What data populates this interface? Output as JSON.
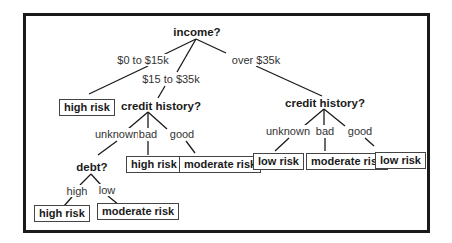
{
  "diagram": {
    "type": "decision-tree",
    "root": {
      "question": "income?",
      "branches": [
        {
          "label": "$0 to $15k",
          "result": "high risk"
        },
        {
          "label": "$15 to $35k",
          "question": "credit history?",
          "branches": [
            {
              "label": "unknown",
              "question": "debt?",
              "branches": [
                {
                  "label": "high",
                  "result": "high risk"
                },
                {
                  "label": "low",
                  "result": "moderate risk"
                }
              ]
            },
            {
              "label": "bad",
              "result": "high risk"
            },
            {
              "label": "good",
              "result": "moderate risk"
            }
          ]
        },
        {
          "label": "over $35k",
          "question": "credit history?",
          "branches": [
            {
              "label": "unknown",
              "result": "low risk"
            },
            {
              "label": "bad",
              "result": "moderate risk"
            },
            {
              "label": "good",
              "result": "low risk"
            }
          ]
        }
      ]
    }
  },
  "nodes": {
    "income": "income?",
    "credit_mid": "credit history?",
    "credit_right": "credit history?",
    "debt": "debt?"
  },
  "edge_labels": {
    "income_low": "$0 to $15k",
    "income_mid": "$15 to $35k",
    "income_high": "over $35k",
    "cm_unknown": "unknown",
    "cm_bad": "bad",
    "cm_good": "good",
    "debt_high": "high",
    "debt_low": "low",
    "cr_unknown": "unknown",
    "cr_bad": "bad",
    "cr_good": "good"
  },
  "leaves": {
    "income_low": "high risk",
    "cm_bad": "high risk",
    "cm_good": "moderate risk",
    "debt_high": "high risk",
    "debt_low": "moderate risk",
    "cr_unknown": "low risk",
    "cr_bad": "moderate risk",
    "cr_good": "low risk"
  },
  "colors": {
    "line": "#1a1a1a",
    "text": "#1a1a1a",
    "frame": "#1a1a1a"
  }
}
